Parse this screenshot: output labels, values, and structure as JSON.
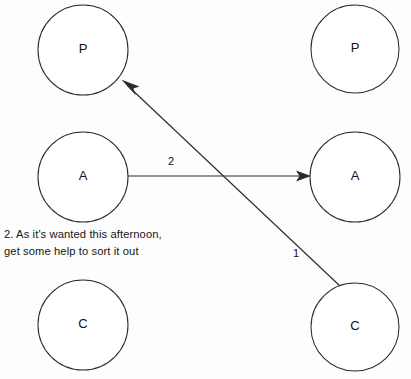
{
  "diagram": {
    "type": "transactional-analysis-ego-state-diagram",
    "background_color": "#fdfdfd",
    "line_color": "#2b2b2b",
    "text_color": "#151515",
    "columns": [
      {
        "name": "left-person",
        "cx": 83
      },
      {
        "name": "right-person",
        "cx": 355
      }
    ],
    "nodes": [
      {
        "id": "left-parent",
        "label": "P",
        "cx": 83,
        "cy": 50,
        "r": 45
      },
      {
        "id": "left-adult",
        "label": "A",
        "cx": 83,
        "cy": 177,
        "r": 45
      },
      {
        "id": "left-child",
        "label": "C",
        "cx": 83,
        "cy": 325,
        "r": 45
      },
      {
        "id": "right-parent",
        "label": "P",
        "cx": 355,
        "cy": 49,
        "r": 44
      },
      {
        "id": "right-adult",
        "label": "A",
        "cx": 355,
        "cy": 177,
        "r": 45
      },
      {
        "id": "right-child",
        "label": "C",
        "cx": 355,
        "cy": 327,
        "r": 44
      }
    ],
    "edges": [
      {
        "id": "transaction-2",
        "label": "2",
        "label_x": 171,
        "label_y": 162,
        "from": "left-adult",
        "to": "right-adult",
        "x1": 128,
        "y1": 176,
        "x2": 310,
        "y2": 176,
        "arrow_at": "end"
      },
      {
        "id": "transaction-1",
        "label": "1",
        "label_x": 296,
        "label_y": 254,
        "from": "right-child",
        "to": "left-parent",
        "x1": 340,
        "y1": 286,
        "x2": 122,
        "y2": 80,
        "arrow_at": "end"
      }
    ]
  },
  "note": {
    "name": "caption-note",
    "lines": [
      "2.  As it's wanted this afternoon,",
      "get some help to sort it out"
    ]
  }
}
